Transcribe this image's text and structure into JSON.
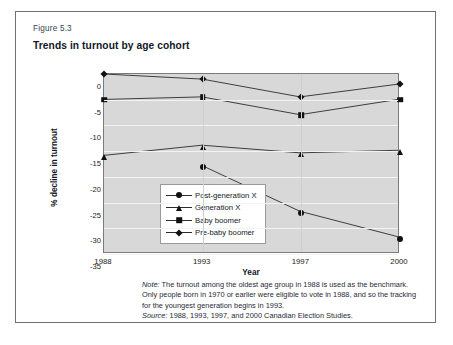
{
  "figure": {
    "number": "Figure 5.3",
    "title": "Trends in turnout by age cohort"
  },
  "axes": {
    "x_title": "Year",
    "y_title": "% decline in turnout",
    "x_ticks": [
      "1988",
      "1993",
      "1997",
      "2000"
    ],
    "y_ticks": [
      "0",
      "-5",
      "-10",
      "-15",
      "-20",
      "-25",
      "-30",
      "-35"
    ]
  },
  "legend": {
    "items": [
      {
        "label": "Post-generation X",
        "marker": "circle-marker"
      },
      {
        "label": "Generation X",
        "marker": "triangle-marker"
      },
      {
        "label": "Baby boomer",
        "marker": "square-marker"
      },
      {
        "label": "Pre-baby boomer",
        "marker": "diamond-marker"
      }
    ]
  },
  "notes": {
    "note_label": "Note:",
    "note_line1": " The turnout among the oldest age group in 1988 is used as the benchmark.",
    "note_line2": "Only people born in 1970 or earlier were eligible to vote in 1988, and so the tracking",
    "note_line3": "for the youngest generation begins in 1993.",
    "source_label": "Source:",
    "source_text": " 1988, 1993, 1997, and 2000 Canadian Election Studies."
  },
  "chart_data": {
    "type": "line",
    "title": "Trends in turnout by age cohort",
    "xlabel": "Year",
    "ylabel": "% decline in turnout",
    "categories": [
      1988,
      1993,
      1997,
      2000
    ],
    "ylim": [
      -35,
      0
    ],
    "xlim": [
      1988,
      2000
    ],
    "grid": true,
    "legend_position": "inside-lower-left",
    "plot_background": "#d8d8d8",
    "line_color": "#2b2b2b",
    "series": [
      {
        "name": "Post-generation X",
        "marker": "circle",
        "x": [
          1993,
          1997,
          2000
        ],
        "values": [
          -18,
          -27,
          -32
        ]
      },
      {
        "name": "Generation X",
        "marker": "triangle",
        "x": [
          1988,
          1993,
          1997,
          2000
        ],
        "values": [
          -16,
          -14,
          -15.5,
          -15
        ]
      },
      {
        "name": "Baby boomer",
        "marker": "square",
        "x": [
          1988,
          1993,
          1997,
          2000
        ],
        "values": [
          -5,
          -4.5,
          -8,
          -5
        ]
      },
      {
        "name": "Pre-baby boomer",
        "marker": "diamond",
        "x": [
          1988,
          1993,
          1997,
          2000
        ],
        "values": [
          0,
          -1,
          -4.5,
          -2
        ]
      }
    ]
  }
}
